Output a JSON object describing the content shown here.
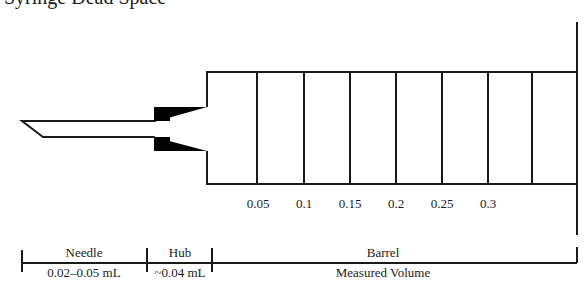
{
  "title": "Syringe Dead Space",
  "graduations": [
    "0.05",
    "0.1",
    "0.15",
    "0.2",
    "0.25",
    "0.3"
  ],
  "sections": {
    "needle": {
      "label": "Needle",
      "volume": "0.02–0.05 mL"
    },
    "hub": {
      "label": "Hub",
      "volume": "~0.04 mL"
    },
    "barrel": {
      "label": "Barrel",
      "volume": "Measured Volume"
    }
  },
  "colors": {
    "stroke": "#1a1a1a",
    "fill": "#000000"
  }
}
